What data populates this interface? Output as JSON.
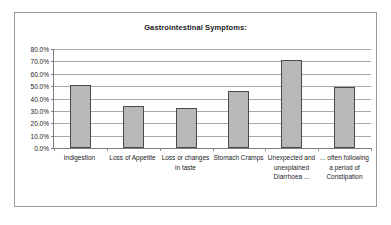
{
  "chart_data": {
    "type": "bar",
    "title": "Gastrointestinal Symptoms:",
    "xlabel": "",
    "ylabel": "",
    "ylim": [
      0,
      80
    ],
    "grid": true,
    "legend": false,
    "categories": [
      "Indigestion",
      "Loss of Appetite",
      "Loss or changes in taste",
      "Stomach Cramps",
      "Unexpected and unexplained Diarrhoea ...",
      "... often following a period of Constipation"
    ],
    "values": [
      51,
      34,
      32,
      46,
      71.5,
      49
    ],
    "ytick_labels": [
      "80.0%",
      "70.0%",
      "60.0%",
      "50.0%",
      "40.0%",
      "30.0%",
      "20.0%",
      "10.0%",
      "0.0%"
    ],
    "ytick_values": [
      80,
      70,
      60,
      50,
      40,
      30,
      20,
      10,
      0
    ],
    "colors": {
      "bar_fill": "#b8b8b8",
      "bar_border": "#4a4a4a",
      "gridline": "#a8a8a8",
      "axis": "#7d7d7d",
      "frame": "#9a9a9a",
      "text": "#1a1a1a",
      "background": "#ffffff"
    }
  }
}
